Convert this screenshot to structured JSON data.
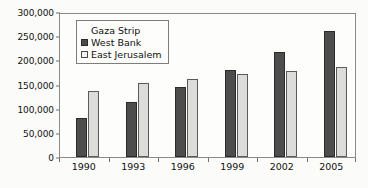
{
  "chart_data": {
    "type": "bar",
    "title": "",
    "subtitle": "",
    "xlabel": "",
    "ylabel": "",
    "categories": [
      "1990",
      "1993",
      "1996",
      "1999",
      "2002",
      "2005"
    ],
    "series": [
      {
        "name": "Gaza Strip",
        "color": "#1c1c1c",
        "values": [
          3000,
          4500,
          5500,
          7000,
          8000,
          0
        ]
      },
      {
        "name": "West Bank",
        "color": "#4d4d4d",
        "values": [
          80000,
          113000,
          144000,
          179000,
          217000,
          260000
        ]
      },
      {
        "name": "East Jerusalem",
        "color": "#dcdcda",
        "values": [
          136000,
          154000,
          161000,
          172000,
          177000,
          186000
        ]
      }
    ],
    "ylim": [
      0,
      300000
    ],
    "ytick_values": [
      0,
      50000,
      100000,
      150000,
      200000,
      250000,
      300000
    ],
    "ytick_labels": [
      "0",
      "50,000",
      "100,000",
      "150,000",
      "200,000",
      "250,000",
      "300,000"
    ],
    "xtick_labels": [
      "1990",
      "1993",
      "1996",
      "1999",
      "2002",
      "2005"
    ],
    "grid": false,
    "legend_position": "upper-left-inside",
    "legend_entries": [
      "Gaza Strip",
      "West Bank",
      "East Jerusalem"
    ]
  }
}
